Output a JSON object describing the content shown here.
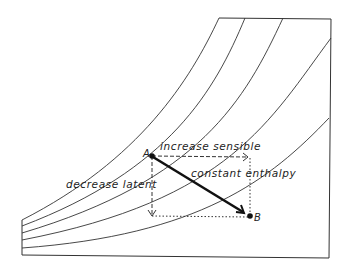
{
  "diagram": {
    "type": "psychrometric-chart-sketch",
    "points": {
      "a": {
        "label": "A"
      },
      "b": {
        "label": "B"
      }
    },
    "labels": {
      "increase_sensible": "increase sensible",
      "decrease_latent": "decrease latent",
      "constant_enthalpy": "constant enthalpy"
    },
    "colors": {
      "line": "#333333",
      "background": "#ffffff"
    }
  }
}
